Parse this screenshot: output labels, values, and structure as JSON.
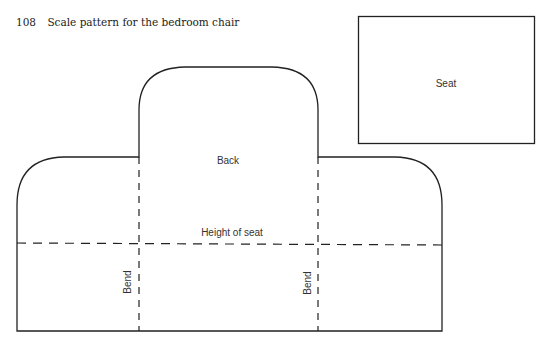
{
  "caption": {
    "number": "108",
    "text": "Scale pattern for the bedroom chair"
  },
  "pieces": {
    "seat": {
      "label": "Seat"
    },
    "back": {
      "label": "Back",
      "height_line_label": "Height of seat",
      "bend_left_label": "Bend",
      "bend_right_label": "Bend"
    }
  },
  "colors": {
    "line": "#222222",
    "text": "#333333",
    "background": "#ffffff"
  }
}
